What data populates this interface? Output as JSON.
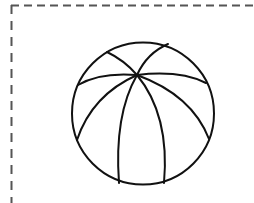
{
  "figure": {
    "colors": {
      "background": "#ffffff",
      "stroke": "#111111",
      "frame": "#555555"
    },
    "frame": {
      "style": "dashed",
      "sides_visible": [
        "top",
        "left"
      ]
    },
    "ball": {
      "center": [
        143,
        113
      ],
      "radius": 71,
      "hub": [
        137,
        75
      ],
      "seam_count": 8
    }
  }
}
